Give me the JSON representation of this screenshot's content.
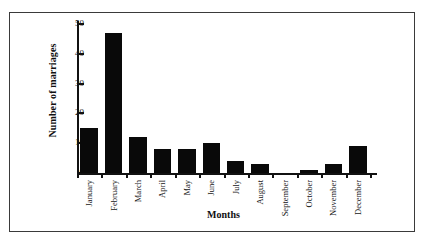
{
  "chart_data": {
    "type": "bar",
    "title": "",
    "xlabel": "Months",
    "ylabel": "Number of marriages",
    "categories": [
      "January",
      "February",
      "March",
      "April",
      "May",
      "June",
      "July",
      "August",
      "September",
      "October",
      "November",
      "December"
    ],
    "values": [
      15,
      47,
      12,
      8,
      8,
      10,
      4,
      3,
      0,
      1,
      3,
      9
    ],
    "ylim": [
      0,
      50
    ],
    "yticks": [
      0,
      10,
      20,
      30,
      40,
      50
    ],
    "ytick_labels": [
      "0",
      "10",
      "20",
      "30",
      "40",
      "50"
    ],
    "grid": false,
    "legend": false,
    "bar_color": "#090909",
    "axis_color": "#111111",
    "background_color": "#ffffff",
    "frame_color": "#3a3a3a"
  }
}
